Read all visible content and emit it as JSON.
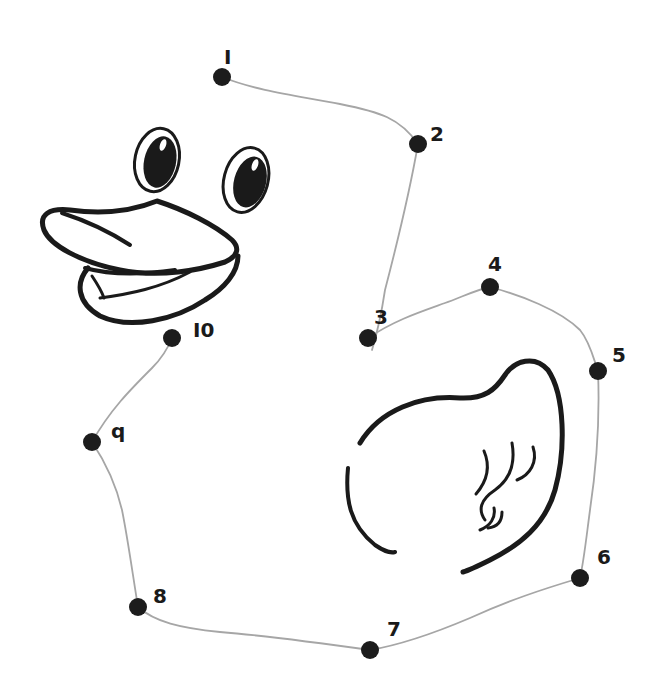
{
  "picture": {
    "subject": "rubber duck",
    "type": "connect-the-dots",
    "ink_color": "#1a1a1a",
    "line_color": "#a6a6a6",
    "background": "#ffffff"
  },
  "dots": [
    {
      "label": "I",
      "number": 1,
      "connected_to_next": true
    },
    {
      "label": "2",
      "number": 2,
      "connected_to_next": true
    },
    {
      "label": "3",
      "number": 3,
      "connected_to_next": true
    },
    {
      "label": "4",
      "number": 4,
      "connected_to_next": true
    },
    {
      "label": "5",
      "number": 5,
      "connected_to_next": true
    },
    {
      "label": "6",
      "number": 6,
      "connected_to_next": true
    },
    {
      "label": "7",
      "number": 7,
      "connected_to_next": true
    },
    {
      "label": "8",
      "number": 8,
      "connected_to_next": true
    },
    {
      "label": "q",
      "number": 9,
      "connected_to_next": true
    },
    {
      "label": "I0",
      "number": 10,
      "connected_to_next": false
    }
  ]
}
